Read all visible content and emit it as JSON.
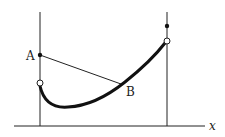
{
  "diagram": {
    "labels": {
      "point_a": "A",
      "point_b": "B",
      "x_axis": "x"
    },
    "colors": {
      "stroke": "#222222",
      "background": "#ffffff"
    },
    "elements": {
      "x_axis": {
        "from": [
          14,
          126
        ],
        "to": [
          205,
          126
        ]
      },
      "left_vertical": {
        "x": 40,
        "y_top": 12,
        "y_bottom": 126
      },
      "right_vertical": {
        "x": 167,
        "y_top": 12,
        "y_bottom": 126
      },
      "point_a": {
        "x": 40,
        "y": 55,
        "type": "filled"
      },
      "left_open_circle": {
        "x": 40,
        "y": 83,
        "type": "open"
      },
      "right_filled_dot": {
        "x": 167,
        "y": 26,
        "type": "filled"
      },
      "right_open_circle": {
        "x": 167,
        "y": 41,
        "type": "open"
      },
      "point_b": {
        "x": 121,
        "y": 84
      },
      "segment_ab": {
        "from": "A",
        "to": "B"
      },
      "curve": "thick curve from left open circle, dipping to a minimum, rising to right open circle"
    }
  }
}
